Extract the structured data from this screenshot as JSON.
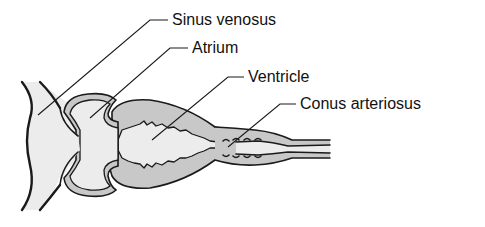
{
  "diagram": {
    "labels": [
      {
        "id": "sinus-venosus",
        "text": "Sinus venosus"
      },
      {
        "id": "atrium",
        "text": "Atrium"
      },
      {
        "id": "ventricle",
        "text": "Ventricle"
      },
      {
        "id": "conus-arteriosus",
        "text": "Conus arteriosus"
      }
    ],
    "colors": {
      "lumen": "#ececec",
      "wall": "#c8c8c8",
      "outline": "#1a1a1a",
      "background": "#ffffff",
      "text": "#111111"
    }
  }
}
